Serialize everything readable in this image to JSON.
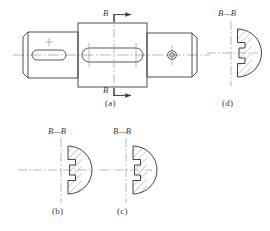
{
  "drawing": {
    "title": "Shaft with keyways - sectional views",
    "line_color": "#3a3a3a",
    "hatch_color": "#6a6a6a",
    "center_line_color": "#8a8a8a",
    "background": "#ffffff"
  },
  "views": {
    "main": {
      "caption": "(a)",
      "name": "front-view-shaft",
      "cut_label_top": "B",
      "cut_label_bottom": "B",
      "features": {
        "left_keyway": "rounded-slot",
        "middle_keyway": "rounded-slot",
        "right_hole": "small-circle"
      }
    },
    "section_d": {
      "caption": "(d)",
      "section_label": "B—B",
      "name": "section-view-d"
    },
    "section_b": {
      "caption": "(b)",
      "section_label": "B—B",
      "name": "section-view-b"
    },
    "section_c": {
      "caption": "(c)",
      "section_label": "B—B",
      "name": "section-view-c"
    }
  }
}
